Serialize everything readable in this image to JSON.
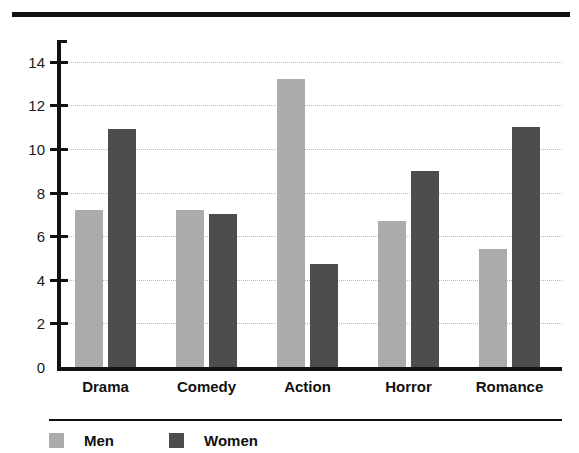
{
  "chart_data": {
    "type": "bar",
    "title": "",
    "subtitle": "",
    "xlabel": "",
    "ylabel": "",
    "categories": [
      "Drama",
      "Comedy",
      "Action",
      "Horror",
      "Romance"
    ],
    "series": [
      {
        "name": "Men",
        "color": "#ababab",
        "values": [
          7.3,
          7.3,
          13.3,
          6.8,
          5.5
        ]
      },
      {
        "name": "Women",
        "color": "#4d4d4d",
        "values": [
          11.0,
          7.1,
          4.8,
          9.1,
          11.1
        ]
      }
    ],
    "ylim": [
      0,
      15
    ],
    "yticks": [
      0,
      2,
      4,
      6,
      8,
      10,
      12,
      14
    ],
    "ytick_labels": [
      "0",
      "2",
      "4",
      "6",
      "8",
      "10",
      "12",
      "14"
    ],
    "grid": true,
    "grid_style": "dotted",
    "grid_color": "#b9b9b9",
    "legend_position": "bottom-left",
    "legend_entries": [
      {
        "label": "Men",
        "swatch": "#ababab"
      },
      {
        "label": "Women",
        "swatch": "#4d4d4d"
      }
    ]
  },
  "decorations": {
    "top_rule_color": "#111111",
    "legend_rule_color": "#111111",
    "axis_color": "#111111",
    "background": "#ffffff"
  }
}
